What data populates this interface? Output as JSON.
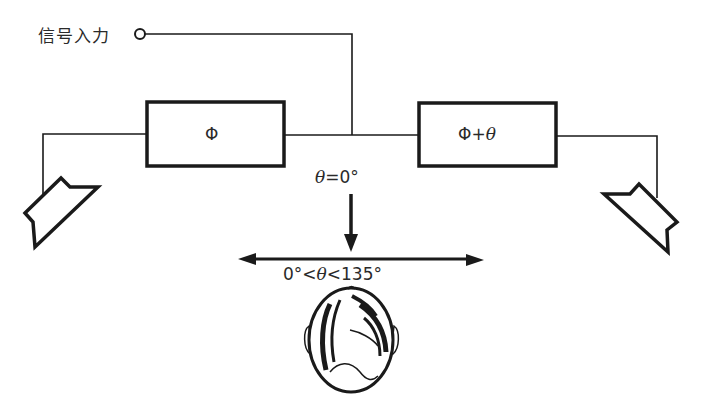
{
  "diagram": {
    "input": {
      "label": "信号入力"
    },
    "blocks": [
      {
        "id": "phase-left",
        "label": "Φ"
      },
      {
        "id": "phase-right",
        "label": "Φ+",
        "symbol": "θ"
      }
    ],
    "annotations": {
      "theta_zero": {
        "symbol": "θ",
        "text": "=0°"
      },
      "theta_range": {
        "prefix": "0°<",
        "symbol": "θ",
        "suffix": "<135°"
      }
    },
    "elements": [
      "signal-input-terminal",
      "left-speaker",
      "right-speaker",
      "listener-head",
      "down-arrow",
      "double-arrow"
    ],
    "colors": {
      "line": "#1a1a1a",
      "background": "#ffffff"
    }
  }
}
